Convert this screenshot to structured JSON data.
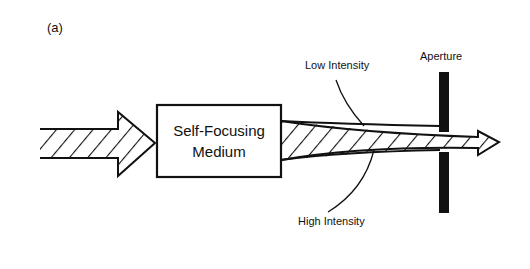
{
  "figure": {
    "label": "(a)",
    "medium": {
      "line1": "Self-Focusing",
      "line2": "Medium"
    },
    "labels": {
      "low_intensity": "Low Intensity",
      "high_intensity": "High Intensity",
      "aperture": "Aperture"
    },
    "colors": {
      "ink": "#111111",
      "background": "#ffffff"
    }
  }
}
